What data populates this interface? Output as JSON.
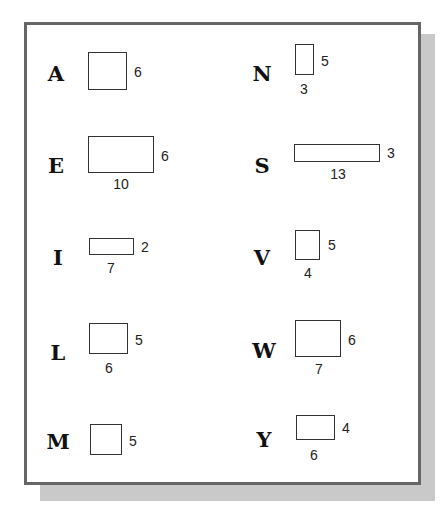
{
  "figures": [
    {
      "letter": "A",
      "width_label": "",
      "height_label": "6",
      "letter_pos": [
        56,
        73
      ],
      "rect": [
        88,
        52,
        39,
        38
      ],
      "h_pos": [
        138,
        72
      ],
      "w_pos": null
    },
    {
      "letter": "E",
      "width_label": "10",
      "height_label": "6",
      "letter_pos": [
        56,
        165
      ],
      "rect": [
        88,
        136,
        66,
        37
      ],
      "h_pos": [
        165,
        156
      ],
      "w_pos": [
        121,
        184
      ]
    },
    {
      "letter": "I",
      "width_label": "7",
      "height_label": "2",
      "letter_pos": [
        58,
        257
      ],
      "rect": [
        89,
        238,
        45,
        17
      ],
      "h_pos": [
        145,
        247
      ],
      "w_pos": [
        111,
        268
      ]
    },
    {
      "letter": "L",
      "width_label": "6",
      "height_label": "5",
      "letter_pos": [
        58,
        352
      ],
      "rect": [
        89,
        323,
        39,
        31
      ],
      "h_pos": [
        139,
        340
      ],
      "w_pos": [
        109,
        368
      ]
    },
    {
      "letter": "M",
      "width_label": "",
      "height_label": "5",
      "letter_pos": [
        58,
        441
      ],
      "rect": [
        90,
        424,
        32,
        31
      ],
      "h_pos": [
        133,
        441
      ],
      "w_pos": null
    },
    {
      "letter": "N",
      "width_label": "3",
      "height_label": "5",
      "letter_pos": [
        262,
        73
      ],
      "rect": [
        295,
        44,
        19,
        31
      ],
      "h_pos": [
        325,
        61
      ],
      "w_pos": [
        304,
        89
      ]
    },
    {
      "letter": "S",
      "width_label": "13",
      "height_label": "3",
      "letter_pos": [
        262,
        165
      ],
      "rect": [
        294,
        144,
        86,
        18
      ],
      "h_pos": [
        391,
        153
      ],
      "w_pos": [
        338,
        174
      ]
    },
    {
      "letter": "V",
      "width_label": "4",
      "height_label": "5",
      "letter_pos": [
        262,
        257
      ],
      "rect": [
        295,
        230,
        25,
        30
      ],
      "h_pos": [
        332,
        245
      ],
      "w_pos": [
        308,
        273
      ]
    },
    {
      "letter": "W",
      "width_label": "7",
      "height_label": "6",
      "letter_pos": [
        264,
        350
      ],
      "rect": [
        295,
        320,
        46,
        37
      ],
      "h_pos": [
        352,
        340
      ],
      "w_pos": [
        319,
        369
      ]
    },
    {
      "letter": "Y",
      "width_label": "6",
      "height_label": "4",
      "letter_pos": [
        264,
        439
      ],
      "rect": [
        296,
        415,
        39,
        25
      ],
      "h_pos": [
        346,
        428
      ],
      "w_pos": [
        314,
        455
      ]
    }
  ],
  "colors": {
    "border": "#666666",
    "shadow": "#c9c9c9",
    "rect_stroke": "#333333"
  }
}
